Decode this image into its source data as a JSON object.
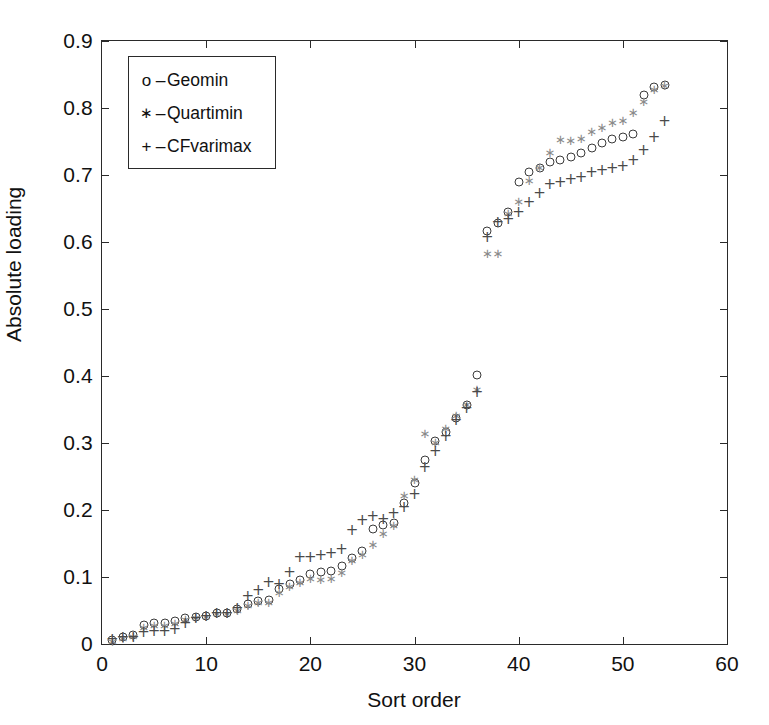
{
  "figure": {
    "background": "#ffffff",
    "axis_color": "#2a2a2a"
  },
  "axes": {
    "x_title": "Sort order",
    "y_title": "Absolute loading",
    "x_ticks": [
      "0",
      "10",
      "20",
      "30",
      "40",
      "50",
      "60"
    ],
    "y_ticks": [
      "0",
      "0.1",
      "0.2",
      "0.3",
      "0.4",
      "0.5",
      "0.6",
      "0.7",
      "0.8",
      "0.9"
    ]
  },
  "legend": {
    "entries": [
      {
        "marker": "o",
        "dash": "–",
        "label": "Geomin",
        "marker_name": "circle-marker"
      },
      {
        "marker": "∗",
        "dash": "–",
        "label": "Quartimin",
        "marker_name": "star-marker"
      },
      {
        "marker": "+",
        "dash": "–",
        "label": "CFvarimax",
        "marker_name": "plus-marker"
      }
    ]
  },
  "chart_data": {
    "type": "scatter",
    "title": "",
    "xlabel": "Sort order",
    "ylabel": "Absolute loading",
    "xlim": [
      0,
      60
    ],
    "ylim": [
      0,
      0.9
    ],
    "xticks": [
      0,
      10,
      20,
      30,
      40,
      50,
      60
    ],
    "yticks": [
      0,
      0.1,
      0.2,
      0.3,
      0.4,
      0.5,
      0.6,
      0.7,
      0.8,
      0.9
    ],
    "grid": false,
    "legend_position": "upper-left-inside",
    "x": [
      1,
      2,
      3,
      4,
      5,
      6,
      7,
      8,
      9,
      10,
      11,
      12,
      13,
      14,
      15,
      16,
      17,
      18,
      19,
      20,
      21,
      22,
      23,
      24,
      25,
      26,
      27,
      28,
      29,
      30,
      31,
      32,
      33,
      34,
      35,
      36,
      37,
      38,
      39,
      40,
      41,
      42,
      43,
      44,
      45,
      46,
      47,
      48,
      49,
      50,
      51,
      52,
      53,
      54
    ],
    "series": [
      {
        "name": "Geomin",
        "marker": "o",
        "color": "#3a3a3a",
        "values": [
          0.006,
          0.01,
          0.014,
          0.029,
          0.031,
          0.031,
          0.035,
          0.039,
          0.041,
          0.042,
          0.046,
          0.047,
          0.052,
          0.06,
          0.064,
          0.066,
          0.082,
          0.09,
          0.096,
          0.104,
          0.108,
          0.109,
          0.117,
          0.128,
          0.139,
          0.171,
          0.177,
          0.18,
          0.21,
          0.241,
          0.274,
          0.303,
          0.317,
          0.338,
          0.357,
          0.402,
          0.617,
          0.628,
          0.645,
          0.69,
          0.705,
          0.71,
          0.72,
          0.722,
          0.727,
          0.733,
          0.741,
          0.748,
          0.753,
          0.757,
          0.761,
          0.82,
          0.831,
          0.835
        ]
      },
      {
        "name": "Quartimin",
        "marker": "*",
        "color": "#8a8a8a",
        "values": [
          0.005,
          0.009,
          0.012,
          0.026,
          0.028,
          0.028,
          0.031,
          0.037,
          0.04,
          0.042,
          0.046,
          0.047,
          0.051,
          0.058,
          0.062,
          0.063,
          0.078,
          0.086,
          0.092,
          0.098,
          0.097,
          0.099,
          0.107,
          0.126,
          0.134,
          0.149,
          0.165,
          0.178,
          0.222,
          0.247,
          0.315,
          0.302,
          0.322,
          0.342,
          0.358,
          0.381,
          0.584,
          0.584,
          0.643,
          0.661,
          0.692,
          0.712,
          0.734,
          0.754,
          0.752,
          0.755,
          0.766,
          0.772,
          0.779,
          0.782,
          0.794,
          0.811,
          0.828,
          0.835
        ]
      },
      {
        "name": "CFvarimax",
        "marker": "+",
        "color": "#4a4a4a",
        "values": [
          0.008,
          0.011,
          0.01,
          0.018,
          0.02,
          0.019,
          0.023,
          0.031,
          0.039,
          0.042,
          0.046,
          0.047,
          0.053,
          0.071,
          0.08,
          0.092,
          0.09,
          0.107,
          0.13,
          0.13,
          0.133,
          0.136,
          0.142,
          0.17,
          0.185,
          0.191,
          0.186,
          0.196,
          0.204,
          0.224,
          0.264,
          0.288,
          0.311,
          0.334,
          0.352,
          0.376,
          0.608,
          0.63,
          0.635,
          0.645,
          0.66,
          0.673,
          0.687,
          0.69,
          0.694,
          0.697,
          0.704,
          0.708,
          0.71,
          0.714,
          0.722,
          0.738,
          0.757,
          0.78
        ]
      }
    ]
  }
}
